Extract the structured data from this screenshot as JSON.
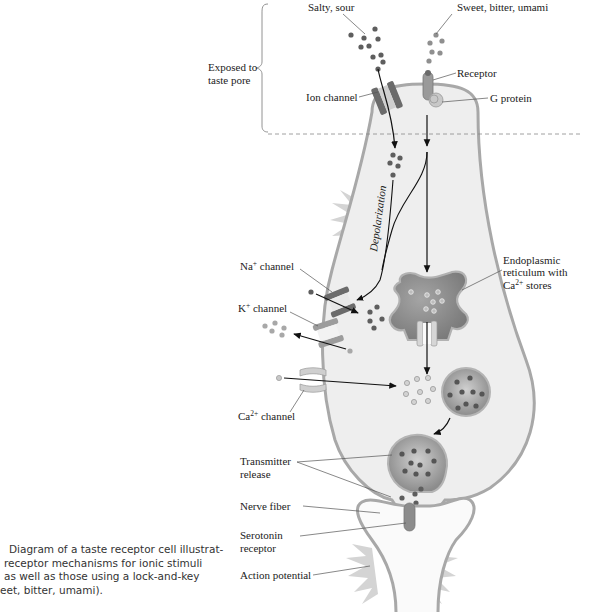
{
  "figure": {
    "type": "taste receptor cell diagram",
    "labels": {
      "salty_sour": "Salty, sour",
      "sweet_bitter_umami": "Sweet, bitter, umami",
      "exposed_line1": "Exposed to",
      "exposed_line2": "taste pore",
      "receptor": "Receptor",
      "ion_channel": "Ion channel",
      "g_protein": "G protein",
      "depolarization": "Depolarization",
      "na_channel_base": "Na",
      "na_channel_sup": "+",
      "na_channel_rest": " channel",
      "k_channel_base": "K",
      "k_channel_sup": "+",
      "k_channel_rest": " channel",
      "ca_channel_base": "Ca",
      "ca_channel_sup": "2+",
      "ca_channel_rest": " channel",
      "er_line1": "Endoplasmic",
      "er_line2": "reticulum with",
      "er_line3_base": "Ca",
      "er_line3_sup": "2+",
      "er_line3_rest": " stores",
      "transmitter_line1": "Transmitter",
      "transmitter_line2": "release",
      "nerve_fiber": "Nerve fiber",
      "serotonin_line1": "Serotonin",
      "serotonin_line2": "receptor",
      "action_potential": "Action potential"
    },
    "colors": {
      "cell_fill": "#eeeeee",
      "cell_stroke": "#a8a8a8",
      "dark_ion": "#5e5e5e",
      "light_ion": "#9a9a9a",
      "channel_dark": "#6b6b6b",
      "channel_light": "#c4c4c4",
      "starburst": "#cfcfcf"
    }
  },
  "caption": {
    "lines": [
      "Diagram of a taste receptor cell illustrat-",
      "receptor mechanisms for ionic stimuli",
      "as well as those using a lock-and-key",
      "eet, bitter, umami)."
    ]
  }
}
